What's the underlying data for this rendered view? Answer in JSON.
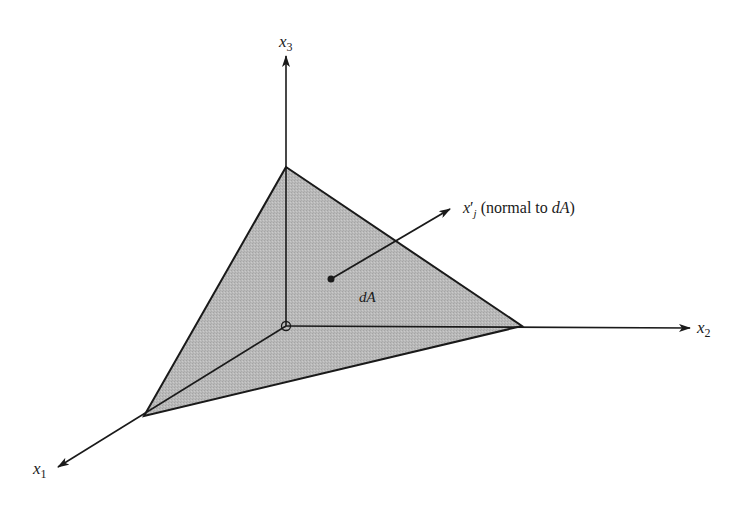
{
  "diagram": {
    "axes": {
      "x1": {
        "name": "x",
        "sub": "1"
      },
      "x2": {
        "name": "x",
        "sub": "2"
      },
      "x3": {
        "name": "x",
        "sub": "3"
      }
    },
    "area_label": "dA",
    "normal": {
      "symbol": "x",
      "prime": "′",
      "sub": "j",
      "text_open": " (normal to ",
      "text_ref": "dA",
      "text_close": ")"
    },
    "colors": {
      "surface_fill": "#b8b8b8",
      "lines": "#1a1a1a",
      "background": "#ffffff"
    }
  }
}
